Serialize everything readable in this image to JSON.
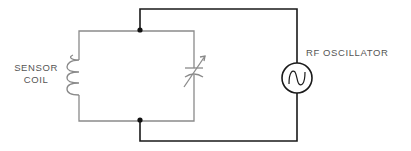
{
  "labels": {
    "sensor_coil_line1": "SENSOR",
    "sensor_coil_line2": "COIL",
    "rf_oscillator": "RF OSCILLATOR"
  },
  "components": [
    {
      "id": "sensor-coil",
      "type": "inductor",
      "label": "SENSOR COIL"
    },
    {
      "id": "variable-capacitor",
      "type": "variable-capacitor"
    },
    {
      "id": "rf-oscillator",
      "type": "ac-source",
      "label": "RF OSCILLATOR"
    }
  ],
  "colors": {
    "tank_circuit": "#8a8a8a",
    "external_wire": "#1a1a1a",
    "label_text": "#555555"
  }
}
